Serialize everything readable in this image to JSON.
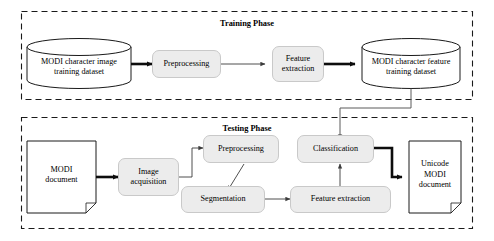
{
  "diagram": {
    "colors": {
      "box_fill": "#ececec",
      "box_stroke": "#c9c9c9",
      "shape_stroke": "#1a1a1a",
      "arrow_thick": "#0d0d0d",
      "arrow_thin": "#555555",
      "dashed_border": "#1a1a1a",
      "background": "#ffffff"
    },
    "phases": [
      {
        "id": "training",
        "title": "Training Phase",
        "nodes": [
          {
            "id": "train-input-db",
            "type": "cylinder",
            "label": "MODI character image\ntraining dataset"
          },
          {
            "id": "train-preprocessing",
            "type": "rounded-box",
            "label": "Preprocessing"
          },
          {
            "id": "train-feature-extraction",
            "type": "rounded-box",
            "label": "Feature\nextraction"
          },
          {
            "id": "train-output-db",
            "type": "cylinder",
            "label": "MODI character feature\ntraining dataset"
          }
        ],
        "edges": [
          {
            "from": "train-input-db",
            "to": "train-preprocessing",
            "weight": "thick"
          },
          {
            "from": "train-preprocessing",
            "to": "train-feature-extraction",
            "weight": "thin"
          },
          {
            "from": "train-feature-extraction",
            "to": "train-output-db",
            "weight": "thick"
          }
        ]
      },
      {
        "id": "testing",
        "title": "Testing Phase",
        "nodes": [
          {
            "id": "test-input-document",
            "type": "document",
            "label": "MODI\ndocument"
          },
          {
            "id": "test-image-acquisition",
            "type": "rounded-box",
            "label": "Image\nacquisition"
          },
          {
            "id": "test-preprocessing",
            "type": "rounded-box",
            "label": "Preprocessing"
          },
          {
            "id": "test-segmentation",
            "type": "rounded-box",
            "label": "Segmentation"
          },
          {
            "id": "test-feature-extraction",
            "type": "rounded-box",
            "label": "Feature extraction"
          },
          {
            "id": "test-classification",
            "type": "rounded-box",
            "label": "Classification"
          },
          {
            "id": "test-output-document",
            "type": "document",
            "label": "Unicode\nMODI\ndocument"
          }
        ],
        "edges": [
          {
            "from": "test-input-document",
            "to": "test-image-acquisition",
            "weight": "thick"
          },
          {
            "from": "test-image-acquisition",
            "to": "test-preprocessing",
            "weight": "thin"
          },
          {
            "from": "test-preprocessing",
            "to": "test-segmentation",
            "weight": "thin"
          },
          {
            "from": "test-segmentation",
            "to": "test-feature-extraction",
            "weight": "thin"
          },
          {
            "from": "test-feature-extraction",
            "to": "test-classification",
            "weight": "thin"
          },
          {
            "from": "test-classification",
            "to": "test-output-document",
            "weight": "thick"
          }
        ]
      }
    ],
    "cross_phase_edge": {
      "from": "train-output-db",
      "to": "test-classification",
      "weight": "thin"
    }
  }
}
